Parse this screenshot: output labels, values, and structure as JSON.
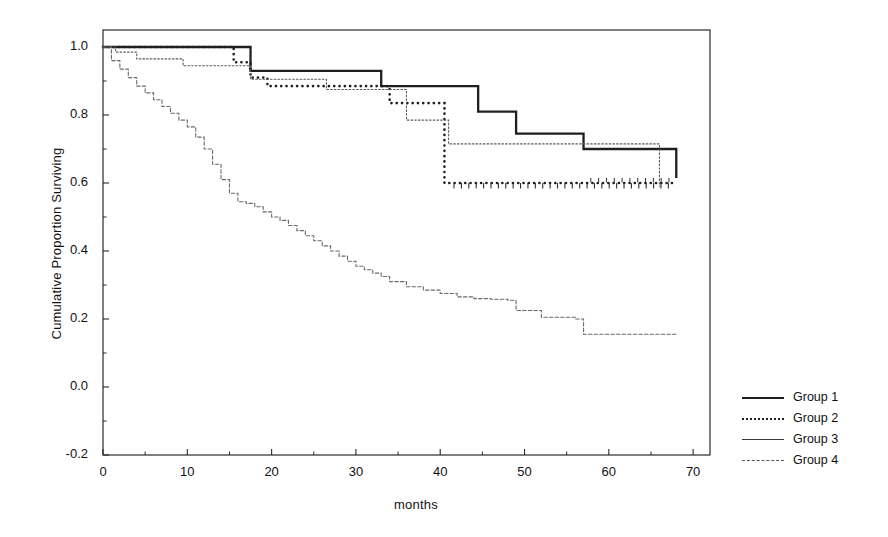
{
  "chart_data": {
    "type": "line",
    "title": "",
    "xlabel": "months",
    "ylabel": "Cumulative Proportion Surviving",
    "xlim": [
      0,
      72
    ],
    "ylim": [
      -0.2,
      1.05
    ],
    "xticks": [
      0,
      10,
      20,
      30,
      40,
      50,
      60,
      70
    ],
    "xtick_labels": [
      "0",
      "10",
      "20",
      "30",
      "40",
      "50",
      "60",
      "70"
    ],
    "yticks": [
      -0.2,
      0.0,
      0.2,
      0.4,
      0.6,
      0.8,
      1.0
    ],
    "ytick_labels": [
      "-0.2",
      "0.0",
      "0.2",
      "0.4",
      "0.6",
      "0.8",
      "1.0"
    ],
    "grid": false,
    "legend_position": "right",
    "step_shape": "post",
    "series": [
      {
        "name": "Group 1",
        "style": "solid-thick",
        "color": "#1f1f1f",
        "x": [
          0,
          15,
          17.5,
          26.5,
          33,
          38.5,
          44.5,
          49,
          57,
          68
        ],
        "y": [
          1.0,
          1.0,
          0.93,
          0.93,
          0.885,
          0.885,
          0.81,
          0.745,
          0.7,
          0.615
        ]
      },
      {
        "name": "Group 2",
        "style": "dotted-bold",
        "color": "#1f1f1f",
        "x": [
          0,
          13,
          15.5,
          17.5,
          19.5,
          34,
          40.5,
          68
        ],
        "y": [
          1.0,
          1.0,
          0.955,
          0.91,
          0.885,
          0.835,
          0.6,
          0.6
        ]
      },
      {
        "name": "Group 3",
        "style": "dotted-fine",
        "color": "#5a5a5a",
        "x": [
          0,
          1.5,
          4,
          9.5,
          17.5,
          26.5,
          33,
          36,
          41,
          66
        ],
        "y": [
          1.0,
          0.985,
          0.965,
          0.945,
          0.905,
          0.875,
          0.875,
          0.785,
          0.715,
          0.59
        ]
      },
      {
        "name": "Group 4",
        "style": "dashed-thin",
        "color": "#6a6a6a",
        "x": [
          0,
          1,
          2,
          3,
          4,
          5,
          6,
          7,
          8,
          9,
          10,
          11,
          12,
          13,
          14,
          15,
          16,
          17,
          18,
          19,
          20,
          21,
          22,
          23,
          24,
          25,
          26,
          27,
          28,
          29,
          30,
          31,
          32,
          33,
          34,
          36,
          38,
          40,
          42,
          44,
          46,
          48,
          49,
          52,
          56,
          57,
          62,
          68
        ],
        "y": [
          1.0,
          0.96,
          0.935,
          0.91,
          0.885,
          0.865,
          0.845,
          0.825,
          0.805,
          0.785,
          0.765,
          0.735,
          0.7,
          0.655,
          0.61,
          0.57,
          0.545,
          0.54,
          0.53,
          0.515,
          0.5,
          0.49,
          0.475,
          0.46,
          0.445,
          0.43,
          0.415,
          0.4,
          0.385,
          0.37,
          0.355,
          0.345,
          0.335,
          0.325,
          0.31,
          0.295,
          0.285,
          0.275,
          0.265,
          0.26,
          0.258,
          0.255,
          0.225,
          0.205,
          0.2,
          0.155,
          0.155,
          0.155
        ]
      }
    ]
  },
  "axes": {
    "ylabel_text": "Cumulative Proportion Surviving",
    "xlabel_text": "months"
  },
  "legend": {
    "items": [
      {
        "label": "Group 1"
      },
      {
        "label": "Group 2"
      },
      {
        "label": "Group 3"
      },
      {
        "label": "Group 4"
      }
    ]
  }
}
